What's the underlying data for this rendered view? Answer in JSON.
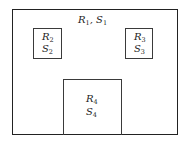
{
  "regions": [
    {
      "id": "region-1",
      "r_symbol": "R",
      "r_sub": "1",
      "s_symbol": "S",
      "s_sub": "1",
      "separator": ", "
    },
    {
      "id": "region-2",
      "r_symbol": "R",
      "r_sub": "2",
      "s_symbol": "S",
      "s_sub": "2"
    },
    {
      "id": "region-3",
      "r_symbol": "R",
      "r_sub": "3",
      "s_symbol": "S",
      "s_sub": "3"
    },
    {
      "id": "region-4",
      "r_symbol": "R",
      "r_sub": "4",
      "s_symbol": "S",
      "s_sub": "4"
    }
  ]
}
